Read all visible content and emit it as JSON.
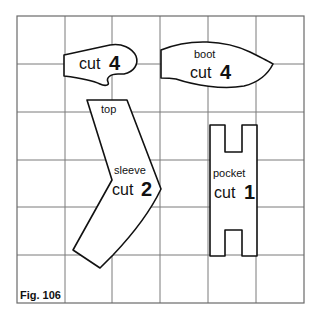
{
  "figure": {
    "caption": "Fig. 106",
    "grid": {
      "columns": 6,
      "rows": 6
    }
  },
  "pieces": {
    "mitten": {
      "label": "cut",
      "count": "4"
    },
    "boot": {
      "name": "boot",
      "label": "cut",
      "count": "4"
    },
    "sleeve": {
      "top_label": "top",
      "name": "sleeve",
      "label": "cut",
      "count": "2"
    },
    "pocket": {
      "name": "pocket",
      "label": "cut",
      "count": "1"
    }
  },
  "colors": {
    "grid": "#7a7a7a",
    "outline": "#111111",
    "background": "#ffffff"
  }
}
